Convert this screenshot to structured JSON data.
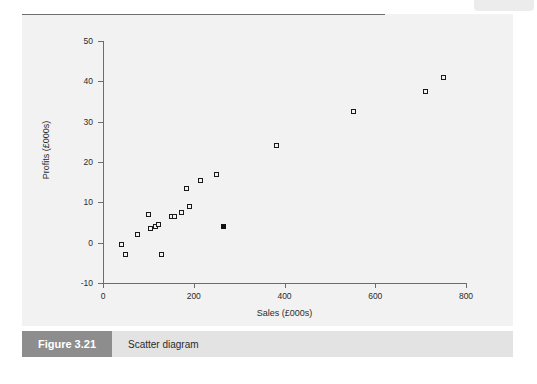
{
  "figure": {
    "number_label": "Figure 3.21",
    "caption": "Scatter diagram"
  },
  "chart_data": {
    "type": "scatter",
    "title": "",
    "xlabel": "Sales (£000s)",
    "ylabel": "Profits (£000s)",
    "xlim": [
      0,
      800
    ],
    "ylim": [
      -10,
      50
    ],
    "xticks": [
      0,
      200,
      400,
      600,
      800
    ],
    "xtick_labels": [
      "0",
      "200",
      "400",
      "600",
      "800"
    ],
    "yticks": [
      -10,
      0,
      10,
      20,
      30,
      40,
      50
    ],
    "ytick_labels": [
      "-10",
      "0",
      "10",
      "20",
      "30",
      "40",
      "50"
    ],
    "grid": false,
    "legend": null,
    "zero_reference_line": {
      "y": 0,
      "color": "#6f6f6f",
      "x_from": 0,
      "x_to": 800
    },
    "marker_styles": {
      "open": {
        "shape": "square",
        "fill": "none",
        "edge": "#1a1a1a"
      },
      "highlighted": {
        "shape": "square",
        "fill": "#111111",
        "edge": "#111111"
      }
    },
    "series": [
      {
        "name": "Sales vs Profits",
        "marker": "open",
        "points": [
          {
            "x": 40,
            "y": -0.5
          },
          {
            "x": 50,
            "y": -3
          },
          {
            "x": 75,
            "y": 2
          },
          {
            "x": 100,
            "y": 7
          },
          {
            "x": 105,
            "y": 3.5
          },
          {
            "x": 115,
            "y": 4
          },
          {
            "x": 122,
            "y": 4.5
          },
          {
            "x": 128,
            "y": -3
          },
          {
            "x": 150,
            "y": 6.5
          },
          {
            "x": 158,
            "y": 6.5
          },
          {
            "x": 172,
            "y": 7.5
          },
          {
            "x": 185,
            "y": 13.5
          },
          {
            "x": 190,
            "y": 9
          },
          {
            "x": 215,
            "y": 15.5
          },
          {
            "x": 250,
            "y": 17
          },
          {
            "x": 382,
            "y": 24
          },
          {
            "x": 553,
            "y": 32.5
          },
          {
            "x": 710,
            "y": 37.5
          },
          {
            "x": 750,
            "y": 41
          }
        ]
      },
      {
        "name": "Highlighted observation",
        "marker": "highlighted",
        "points": [
          {
            "x": 265,
            "y": 4
          }
        ]
      }
    ]
  }
}
